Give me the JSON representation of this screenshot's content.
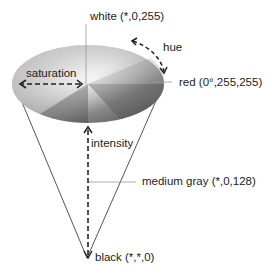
{
  "diagram": {
    "labels": {
      "white": "white (*,0,255)",
      "hue": "hue",
      "saturation": "saturation",
      "red": "red (0°,255,255)",
      "intensity": "intensity",
      "medium_gray": "medium gray (*,0,128)",
      "black": "black (*,*,0)"
    },
    "colors": {
      "line": "#555555",
      "arrow": "#222222",
      "disk_light": "#f4f4f4",
      "disk_dark": "#4a4a4a",
      "leader": "#999999"
    }
  }
}
